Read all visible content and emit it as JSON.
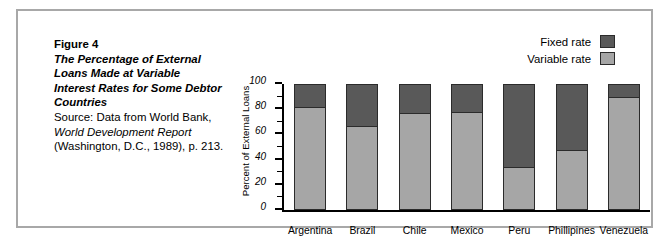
{
  "figure": {
    "number_label": "Figure 4",
    "title_line1": "The Percentage of External",
    "title_line2": "Loans Made at Variable",
    "title_line3": "Interest Rates for Some Debtor",
    "title_line4": "Countries",
    "source_line1": "Source: Data from World Bank,",
    "source_line2": "World Development Report",
    "source_line3": "(Washington, D.C., 1989), p. 213."
  },
  "legend": {
    "position": "top-right",
    "items": [
      {
        "label": "Fixed rate",
        "color": "#595959"
      },
      {
        "label": "Variable rate",
        "color": "#a6a6a6"
      }
    ]
  },
  "chart_data": {
    "type": "bar",
    "stacked": true,
    "title": "The Percentage of External Loans Made at Variable Interest Rates for Some Debtor Countries",
    "xlabel": "",
    "ylabel": "Percent of External Loans",
    "ylim": [
      0,
      100
    ],
    "yticks": [
      0,
      20,
      40,
      60,
      80,
      100
    ],
    "ytick_labels": [
      "0",
      "20",
      "40",
      "60",
      "80",
      "100"
    ],
    "grid": false,
    "legend_position": "top-right",
    "categories": [
      "Argentina",
      "Brazil",
      "Chile",
      "Mexico",
      "Peru",
      "Phillipines",
      "Venezuela"
    ],
    "series": [
      {
        "name": "Variable rate",
        "color": "#a6a6a6",
        "values": [
          82,
          67,
          77,
          78,
          34,
          48,
          90
        ]
      },
      {
        "name": "Fixed rate",
        "color": "#595959",
        "values": [
          18,
          33,
          23,
          22,
          66,
          52,
          10
        ]
      }
    ]
  }
}
